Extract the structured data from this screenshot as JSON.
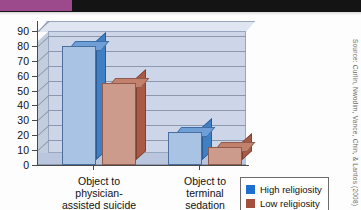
{
  "page": {
    "source_credit": "Source: Curlin, Nwodim, Vance, Chin, & Lantos (2008)"
  },
  "legend": {
    "items": [
      {
        "label": "High religiosity",
        "color": "#1f6fd0",
        "icon": "legend-swatch-icon"
      },
      {
        "label": "Low religiosity",
        "color": "#a3503f",
        "icon": "legend-swatch-icon"
      }
    ]
  },
  "chart_data": {
    "type": "bar",
    "title": "",
    "xlabel": "",
    "ylabel": "",
    "ylim": [
      0,
      90
    ],
    "yticks": [
      0,
      10,
      20,
      30,
      40,
      50,
      60,
      70,
      80,
      90
    ],
    "grid": true,
    "legend_position": "bottom-right",
    "categories": [
      "Object to physician-assisted suicide",
      "Object to terminal sedation"
    ],
    "category_lines": [
      [
        "Object to",
        "physician-",
        "assisted suicide"
      ],
      [
        "Object to",
        "terminal",
        "sedation"
      ]
    ],
    "series": [
      {
        "name": "High religiosity",
        "color": "#a8c3e4",
        "values": [
          80,
          22
        ]
      },
      {
        "name": "Low religiosity",
        "color": "#cd9b8b",
        "values": [
          55,
          12
        ]
      }
    ]
  }
}
